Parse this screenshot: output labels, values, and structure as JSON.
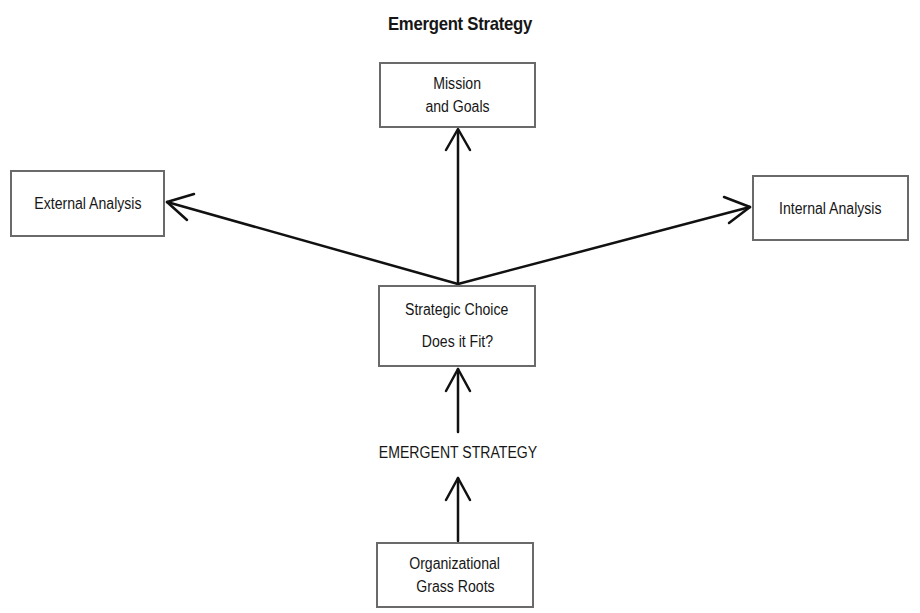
{
  "diagram": {
    "title": "Emergent Strategy",
    "nodes": {
      "mission": {
        "line1": "Mission",
        "line2": "and Goals"
      },
      "external": {
        "line1": "External Analysis"
      },
      "internal": {
        "line1": "Internal Analysis"
      },
      "choice": {
        "line1": "Strategic Choice",
        "line2": "Does it Fit?"
      },
      "emergent": {
        "line1": "EMERGENT STRATEGY"
      },
      "grassroots": {
        "line1": "Organizational",
        "line2": "Grass Roots"
      }
    },
    "edges": [
      {
        "from": "choice",
        "to": "mission"
      },
      {
        "from": "choice",
        "to": "external"
      },
      {
        "from": "choice",
        "to": "internal"
      },
      {
        "from": "emergent",
        "to": "choice"
      },
      {
        "from": "grassroots",
        "to": "emergent"
      }
    ],
    "colors": {
      "line": "#111111",
      "box_border": "#6a6a6a",
      "text": "#161616"
    }
  }
}
